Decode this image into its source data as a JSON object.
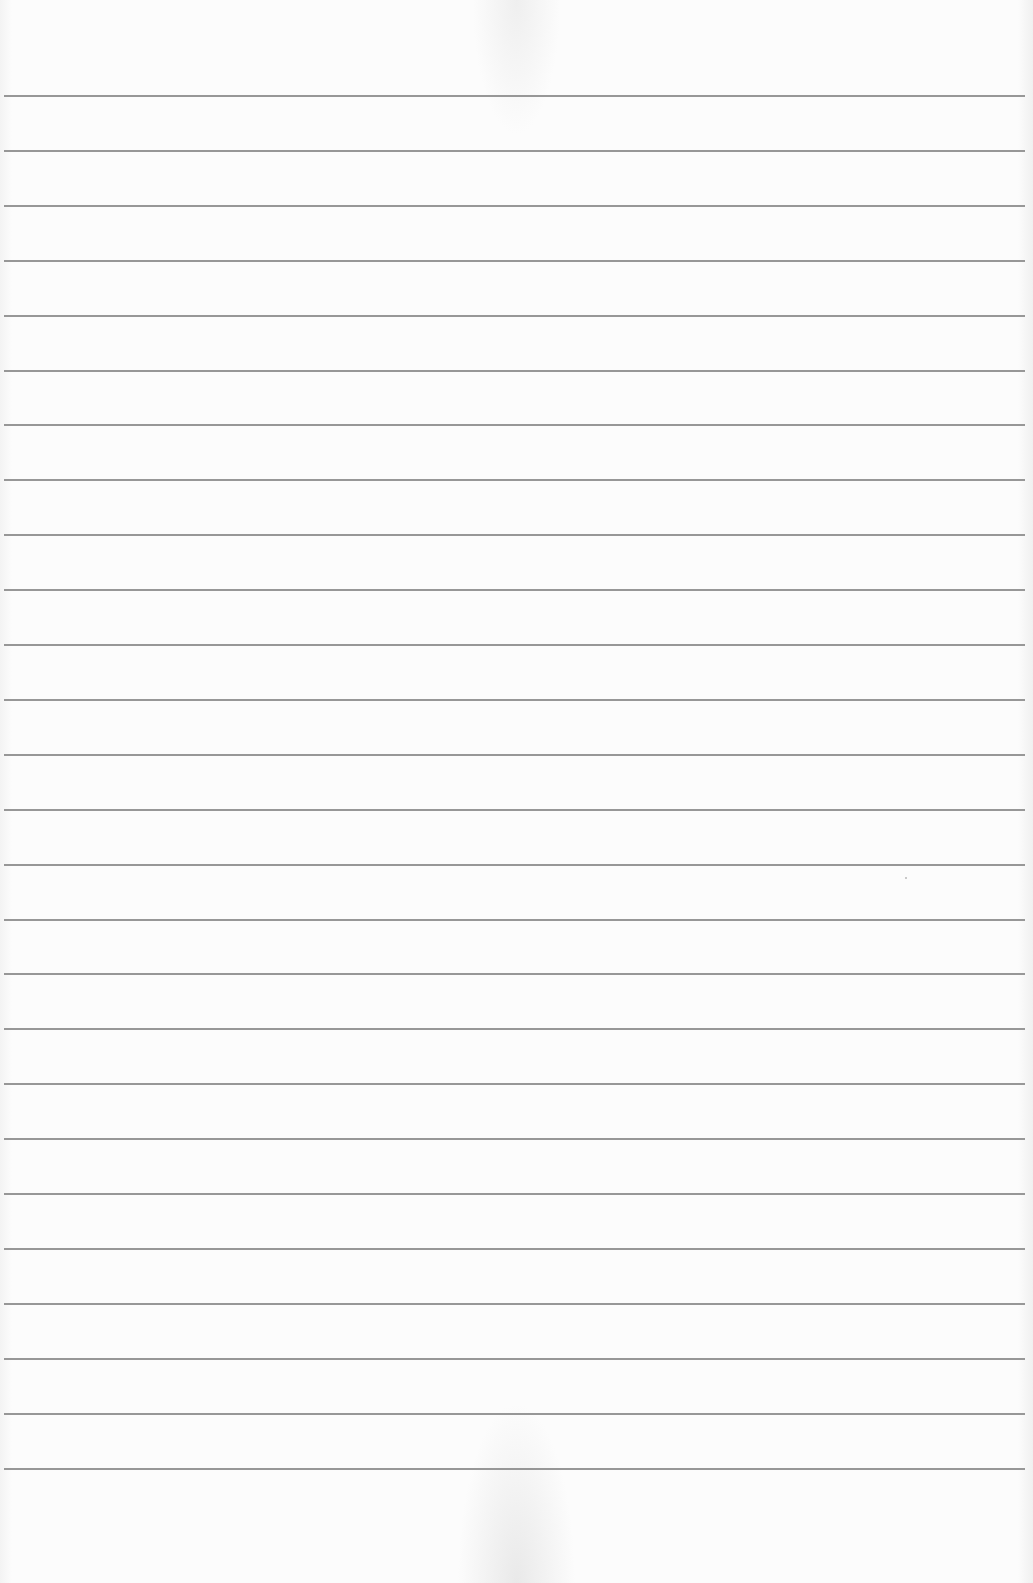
{
  "page": {
    "type": "blank-ruled-paper",
    "background_color": "#fcfcfc",
    "line_color": "#8c8c8c",
    "line_count": 26,
    "first_line_y": 95,
    "line_spacing": 54.9,
    "line_left": 4,
    "line_right": 1025
  }
}
